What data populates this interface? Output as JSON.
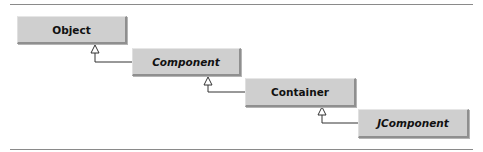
{
  "diagram": {
    "type": "uml-class-hierarchy",
    "classes": [
      {
        "name": "Object",
        "abstract": false
      },
      {
        "name": "Component",
        "abstract": true
      },
      {
        "name": "Container",
        "abstract": false
      },
      {
        "name": "JComponent",
        "abstract": true
      }
    ],
    "relations": [
      {
        "from": "Component",
        "to": "Object",
        "kind": "generalization"
      },
      {
        "from": "Container",
        "to": "Component",
        "kind": "generalization"
      },
      {
        "from": "JComponent",
        "to": "Container",
        "kind": "generalization"
      }
    ],
    "colors": {
      "box_fill": "#cfcfcf",
      "box_shadow": "#8f8f8f",
      "line": "#333333",
      "rule": "#8a8a8a"
    }
  }
}
